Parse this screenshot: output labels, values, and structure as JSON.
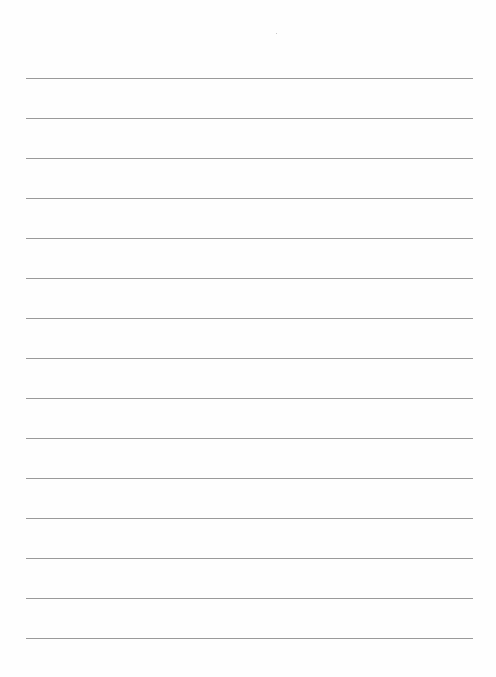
{
  "document": {
    "type": "lined-paper",
    "background": "#fefefe",
    "line_color": "#9a9a9a",
    "line_count": 15,
    "first_line_y": 78,
    "line_spacing": 40,
    "line_left": 26,
    "line_width": 447,
    "text": ""
  }
}
